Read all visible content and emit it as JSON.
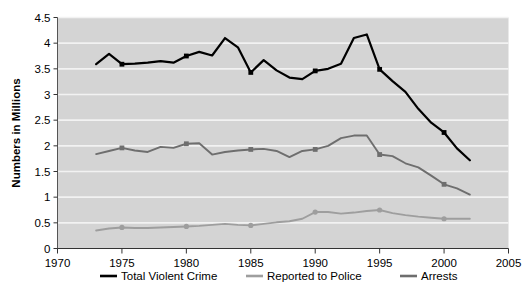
{
  "chart_data": {
    "type": "line",
    "title": "",
    "subtitle": "",
    "xlabel": "",
    "ylabel": "Numbers in Millions",
    "xlim": [
      1970,
      2005
    ],
    "ylim": [
      0,
      4.5
    ],
    "xticks": [
      1970,
      1975,
      1980,
      1985,
      1990,
      1995,
      2000,
      2005
    ],
    "xtick_labels": [
      "1970",
      "1975",
      "1980",
      "1985",
      "1990",
      "1995",
      "2000",
      "2005"
    ],
    "yticks": [
      0,
      0.5,
      1,
      1.5,
      2,
      2.5,
      3,
      3.5,
      4,
      4.5
    ],
    "ytick_labels": [
      "0",
      "0.5",
      "1",
      "1.5",
      "2",
      "2.5",
      "3",
      "3.5",
      "4",
      "4.5"
    ],
    "grid": true,
    "grid_axis": "y",
    "plot_background": "#d4d4d4",
    "grid_color": "#f2f2f2",
    "legend_position": "bottom",
    "marker_years": [
      1975,
      1980,
      1985,
      1990,
      1995,
      2000
    ],
    "x": [
      1973,
      1974,
      1975,
      1976,
      1977,
      1978,
      1979,
      1980,
      1981,
      1982,
      1983,
      1984,
      1985,
      1986,
      1987,
      1988,
      1989,
      1990,
      1991,
      1992,
      1993,
      1994,
      1995,
      1996,
      1997,
      1998,
      1999,
      2000,
      2001,
      2002
    ],
    "series": [
      {
        "name": "Total Violent Crime",
        "color": "#000000",
        "marker": "square",
        "values": [
          3.59,
          3.79,
          3.59,
          3.6,
          3.62,
          3.65,
          3.62,
          3.75,
          3.83,
          3.76,
          4.1,
          3.92,
          3.43,
          3.67,
          3.47,
          3.33,
          3.3,
          3.46,
          3.5,
          3.6,
          4.1,
          4.17,
          3.49,
          3.26,
          3.05,
          2.72,
          2.45,
          2.26,
          1.95,
          1.72
        ]
      },
      {
        "name": "Arrests",
        "color": "#6e6e6e",
        "marker": "square",
        "values": [
          1.84,
          1.9,
          1.96,
          1.91,
          1.88,
          1.98,
          1.96,
          2.04,
          2.05,
          1.83,
          1.88,
          1.91,
          1.93,
          1.94,
          1.9,
          1.78,
          1.9,
          1.93,
          2.0,
          2.15,
          2.2,
          2.2,
          1.83,
          1.8,
          1.66,
          1.58,
          1.42,
          1.25,
          1.17,
          1.05
        ]
      },
      {
        "name": "Reported to Police",
        "color": "#9e9e9e",
        "marker": "circle",
        "values": [
          0.35,
          0.39,
          0.41,
          0.4,
          0.4,
          0.41,
          0.42,
          0.43,
          0.44,
          0.46,
          0.48,
          0.46,
          0.45,
          0.48,
          0.51,
          0.53,
          0.58,
          0.71,
          0.71,
          0.68,
          0.7,
          0.73,
          0.75,
          0.69,
          0.65,
          0.62,
          0.6,
          0.58,
          0.58,
          0.58
        ]
      }
    ],
    "legend": [
      {
        "label": "Total Violent Crime",
        "color": "#000000"
      },
      {
        "label": "Reported to Police",
        "color": "#9e9e9e"
      },
      {
        "label": "Arrests",
        "color": "#6e6e6e"
      }
    ]
  }
}
